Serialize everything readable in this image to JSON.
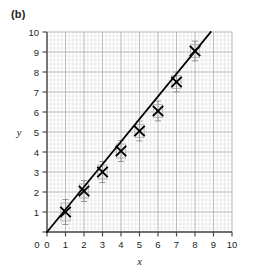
{
  "figure": {
    "panel_label": "(b)",
    "background_color": "#ffffff"
  },
  "chart_data": {
    "type": "scatter",
    "title": "",
    "subtitle": "",
    "xlabel": "x",
    "ylabel": "y",
    "xlim": [
      0,
      10
    ],
    "ylim": [
      0,
      10
    ],
    "xticks": [
      0,
      1,
      2,
      3,
      4,
      5,
      6,
      7,
      8,
      9,
      10
    ],
    "yticks": [
      0,
      1,
      2,
      3,
      4,
      5,
      6,
      7,
      8,
      9,
      10
    ],
    "xtick_labels": [
      "0",
      "1",
      "2",
      "3",
      "4",
      "5",
      "6",
      "7",
      "8",
      "9",
      "10"
    ],
    "ytick_labels": [
      "0",
      "1",
      "2",
      "3",
      "4",
      "5",
      "6",
      "7",
      "8",
      "9",
      "10"
    ],
    "grid": true,
    "grid_minor_step": 0.2,
    "grid_major_step": 1,
    "grid_minor_color": "#d8d8d8",
    "grid_major_color": "#a9a9a9",
    "axis_color": "#4d4d4d",
    "legend": null,
    "legend_position": "none",
    "marker_style": "x-cross",
    "marker_color": "#000000",
    "error_box_color": "#b3b3b3",
    "error_bar_color": "#808080",
    "series": [
      {
        "name": "measurements",
        "x": [
          1,
          2,
          3,
          4,
          5,
          6,
          7,
          8
        ],
        "y": [
          1.0,
          2.05,
          3.0,
          4.05,
          5.05,
          6.05,
          7.5,
          9.05
        ],
        "x_err": [
          0.25,
          0.25,
          0.25,
          0.25,
          0.25,
          0.25,
          0.25,
          0.25
        ],
        "y_err": [
          0.45,
          0.35,
          0.35,
          0.35,
          0.32,
          0.32,
          0.32,
          0.32
        ]
      }
    ],
    "fit_line": {
      "name": "best-fit line",
      "type": "line",
      "color": "#000000",
      "slope": 1.13,
      "intercept": 0,
      "x_start": 0,
      "y_start": 0,
      "x_end": 8.85,
      "y_end": 10
    }
  }
}
